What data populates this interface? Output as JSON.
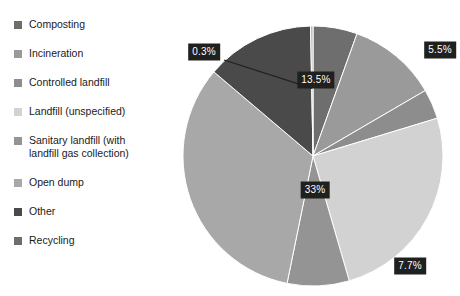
{
  "chart_data": {
    "type": "pie",
    "title": "",
    "subtitle": "",
    "xlabel": "",
    "ylabel": "",
    "unit": "%",
    "grid": false,
    "legend_position": "left",
    "start_angle_deg": 0,
    "direction": "clockwise",
    "categories": [
      "Composting",
      "Incineration",
      "Controlled landfill",
      "Landfill (unspecified)",
      "Sanitary landfill (with landfill gas collection)",
      "Open dump",
      "Other",
      "Recycling"
    ],
    "values": [
      5.5,
      11.1,
      3.7,
      25.2,
      7.7,
      33,
      13.5,
      0.3
    ],
    "value_labels": [
      "5.5%",
      "11.1%",
      "3.7%",
      "25.2%",
      "7.7%",
      "33%",
      "13.5%",
      "0.3%"
    ],
    "colors": [
      "#6e6e6e",
      "#9a9a9a",
      "#8d8d8d",
      "#d2d2d2",
      "#949494",
      "#a8a8a8",
      "#4a4a4a",
      "#b4b4b4"
    ],
    "slices": [
      {
        "label": "Composting",
        "value": 5.5,
        "text": "5.5%",
        "color": "#6e6e6e",
        "label_x": 260,
        "label_y": 40,
        "callout": false
      },
      {
        "label": "Incineration",
        "value": 11.1,
        "text": "11.1%",
        "color": "#9a9a9a",
        "label_x": 315,
        "label_y": 88,
        "callout": false
      },
      {
        "label": "Controlled landfill",
        "value": 3.7,
        "text": "3.7%",
        "color": "#8d8d8d",
        "label_x": 352,
        "label_y": 117,
        "callout": false
      },
      {
        "label": "Landfill (unspecified)",
        "value": 25.2,
        "text": "25.2%",
        "color": "#d2d2d2",
        "label_x": 318,
        "label_y": 190,
        "callout": false
      },
      {
        "label": "Sanitary landfill (with landfill gas collection)",
        "value": 7.7,
        "text": "7.7%",
        "color": "#949494",
        "label_x": 230,
        "label_y": 256,
        "callout": false
      },
      {
        "label": "Open dump",
        "value": 33,
        "text": "33%",
        "color": "#a8a8a8",
        "label_x": 135,
        "label_y": 180,
        "callout": false
      },
      {
        "label": "Other",
        "value": 13.5,
        "text": "13.5%",
        "color": "#4a4a4a",
        "label_x": 136,
        "label_y": 70,
        "callout": false
      },
      {
        "label": "Recycling",
        "value": 0.3,
        "text": "0.3%",
        "color": "#b4b4b4",
        "label_x": 24,
        "label_y": 42,
        "callout": true
      }
    ],
    "geometry": {
      "center_x": 133,
      "center_y": 146,
      "radius": 130
    }
  },
  "legend": {
    "items": [
      {
        "label": "Composting",
        "color": "#6e6e6e"
      },
      {
        "label": "Incineration",
        "color": "#9a9a9a"
      },
      {
        "label": "Controlled landfill",
        "color": "#8d8d8d"
      },
      {
        "label": "Landfill (unspecified)",
        "color": "#d2d2d2"
      },
      {
        "label": "Sanitary landfill (with\nlandfill gas collection)",
        "color": "#949494"
      },
      {
        "label": "Open dump",
        "color": "#a8a8a8"
      },
      {
        "label": "Other",
        "color": "#4a4a4a"
      },
      {
        "label": "Recycling",
        "color": "#6e6e6e"
      }
    ]
  }
}
